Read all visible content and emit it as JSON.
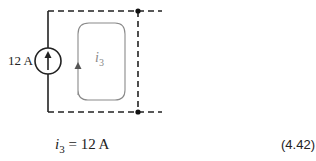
{
  "figure": {
    "source": {
      "label": "12 A",
      "type": "current-source",
      "direction": "up"
    },
    "loop": {
      "label_var": "i",
      "label_sub": "3",
      "direction": "clockwise"
    },
    "colors": {
      "wire": "#222222",
      "loop": "#8a8a8a"
    }
  },
  "equation": {
    "lhs_var": "i",
    "lhs_sub": "3",
    "rhs": " = 12 A",
    "number": "(4.42)"
  }
}
